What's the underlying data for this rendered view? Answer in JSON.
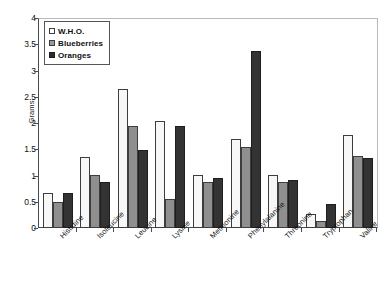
{
  "chart_data": {
    "type": "bar",
    "title": "",
    "xlabel": "",
    "ylabel": "Grams",
    "ylim": [
      0,
      4
    ],
    "ytick_values": [
      4,
      3.5,
      3,
      2.5,
      2,
      1.5,
      1,
      0.5,
      0
    ],
    "ytick_labels": [
      "4",
      "3.5",
      "3",
      "2.5",
      "2",
      "1.5",
      "1",
      "0.5",
      "0"
    ],
    "grid": false,
    "legend_position": "top-left",
    "categories": [
      "Histidine",
      "Isoleucine",
      "Leucine",
      "Lysine",
      "Methionine",
      "Phenylalanine",
      "Threonine",
      "Tryptophan",
      "Valine"
    ],
    "series": [
      {
        "name": "W.H.O.",
        "color": "#f7f7f7",
        "values": [
          0.67,
          1.36,
          2.65,
          2.04,
          1.01,
          1.7,
          1.01,
          0.27,
          1.77
        ]
      },
      {
        "name": "Blueberries",
        "color": "#8f8f8f",
        "values": [
          0.49,
          1.01,
          1.94,
          0.56,
          0.88,
          1.54,
          0.88,
          0.13,
          1.37
        ]
      },
      {
        "name": "Oranges",
        "color": "#333333",
        "values": [
          0.66,
          0.87,
          1.49,
          1.95,
          0.96,
          3.38,
          0.92,
          0.46,
          1.33
        ]
      }
    ]
  },
  "axis": {
    "y_title": "Grams"
  },
  "colors": {
    "series_who": "#f7f7f7",
    "series_blueberries": "#8f8f8f",
    "series_oranges": "#333333",
    "axis_line": "#4a4a4a",
    "frame_line": "#b9b9b9",
    "text": "#111111",
    "background": "#ffffff"
  }
}
